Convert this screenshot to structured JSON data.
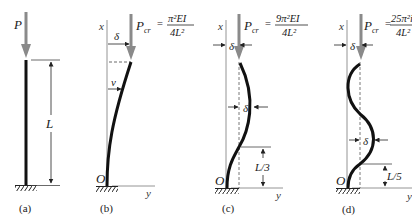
{
  "figure": {
    "colors": {
      "line": "#111111",
      "axis": "#888888",
      "arrow": "#8a8a8a",
      "dim": "#222222"
    },
    "panels": [
      {
        "id": "a",
        "caption": "(a)",
        "load_label": "P",
        "length_label": "L"
      },
      {
        "id": "b",
        "caption": "(b)",
        "axis_x": "x",
        "axis_y": "y",
        "origin": "O",
        "load_label": "P",
        "load_sub": "cr",
        "equals": "=",
        "formula_num": "π²EI",
        "formula_den": "4L²",
        "delta_label": "δ",
        "v_label": "v"
      },
      {
        "id": "c",
        "caption": "(c)",
        "axis_x": "x",
        "axis_y": "y",
        "origin": "O",
        "load_label": "P",
        "load_sub": "cr",
        "equals": "=",
        "formula_num": "9π²EI",
        "formula_den": "4L²",
        "delta_top": "δ",
        "delta_mid": "δ",
        "segment_label": "L/3"
      },
      {
        "id": "d",
        "caption": "(d)",
        "axis_x": "x",
        "axis_y": "y",
        "origin": "O",
        "load_label": "P",
        "load_sub": "cr",
        "equals": "=",
        "formula_num": "25π²i",
        "formula_den": "4L²",
        "delta_top": "δ",
        "delta_mid": "δ",
        "segment_label": "L/5"
      }
    ]
  }
}
